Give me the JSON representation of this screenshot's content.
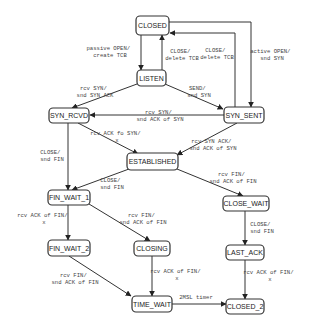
{
  "diagram": {
    "states": {
      "closed": "CLOSED",
      "listen": "LISTEN",
      "syn_rcvd": "SYN_RCVD",
      "syn_sent": "SYN_SENT",
      "established": "ESTABLISHED",
      "fin_wait_1": "FIN_WAIT_1",
      "fin_wait_2": "FIN_WAIT_2",
      "closing": "CLOSING",
      "time_wait": "TIME_WAIT",
      "close_wait": "CLOSE_WAIT",
      "last_ack": "LAST_ACK",
      "closed_2": "CLOSED_2"
    },
    "transitions": {
      "closed_listen": [
        "passive OPEN/",
        "create TCB"
      ],
      "listen_closed": [
        "CLOSE/",
        "delete TCB"
      ],
      "synsent_closed": [
        "CLOSE/",
        "delete TCB"
      ],
      "closed_synsent": [
        "active OPEN/",
        "snd SYN"
      ],
      "listen_synrcvd": [
        "rcv SYN/",
        "snd SYN ACK"
      ],
      "listen_synsent": [
        "SEND/",
        "snd SYN"
      ],
      "synsent_synrcvd": [
        "rcv SYN/",
        "snd ACK of SYN"
      ],
      "synrcvd_established": [
        "rcv ACK fo SYN/",
        "x"
      ],
      "synsent_established": [
        "rcv SYN ACK/",
        "snd ACK of SYN"
      ],
      "synrcvd_finwait1": [
        "CLOSE/",
        "snd FIN"
      ],
      "established_finwait1": [
        "CLOSE/",
        "snd FIN"
      ],
      "established_closewait": [
        "rcv FIN/",
        "snd ACK of FIN"
      ],
      "finwait1_finwait2": [
        "rcv ACK of FIN/",
        "x"
      ],
      "finwait1_closing": [
        "rcv FIN/",
        "snd ACK of FIN"
      ],
      "closewait_lastack": [
        "CLOSE/",
        "snd FIN"
      ],
      "finwait2_timewait": [
        "rcv FIN/",
        "snd ACK of FIN"
      ],
      "closing_timewait": [
        "rcv ACK of FIN/",
        "x"
      ],
      "lastack_closed2": [
        "rcv ACK of FIN/",
        "x"
      ],
      "timewait_closed2": [
        "2MSL timer"
      ]
    }
  }
}
